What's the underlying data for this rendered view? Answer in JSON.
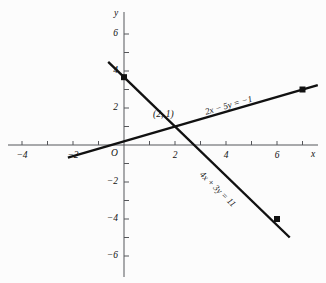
{
  "figure": {
    "background_color": "#fcfcfc",
    "line_color": "#111111",
    "axis_color": "#55565a",
    "width": 326,
    "height": 283
  },
  "axes": {
    "x_name": "x",
    "y_name": "y",
    "origin_label": "O",
    "x_ticks": [
      {
        "value": -4,
        "label": "−4"
      },
      {
        "value": -3,
        "label": ""
      },
      {
        "value": -2,
        "label": "−2"
      },
      {
        "value": -1,
        "label": ""
      },
      {
        "value": 1,
        "label": ""
      },
      {
        "value": 2,
        "label": "2"
      },
      {
        "value": 3,
        "label": ""
      },
      {
        "value": 4,
        "label": "4"
      },
      {
        "value": 5,
        "label": ""
      },
      {
        "value": 6,
        "label": "6"
      },
      {
        "value": 7,
        "label": ""
      }
    ],
    "y_ticks": [
      {
        "value": 6,
        "label": "6"
      },
      {
        "value": 5,
        "label": ""
      },
      {
        "value": 4,
        "label": "4"
      },
      {
        "value": 3,
        "label": ""
      },
      {
        "value": 2,
        "label": "2"
      },
      {
        "value": 1,
        "label": ""
      },
      {
        "value": -1,
        "label": ""
      },
      {
        "value": -2,
        "label": "−2"
      },
      {
        "value": -3,
        "label": ""
      },
      {
        "value": -4,
        "label": "−4"
      },
      {
        "value": -5,
        "label": ""
      },
      {
        "value": -6,
        "label": "−6"
      }
    ]
  },
  "chart_data": {
    "type": "line",
    "title": "",
    "xlabel": "x",
    "ylabel": "y",
    "xlim": [
      -4.9,
      7.9
    ],
    "ylim": [
      -7.0,
      7.1
    ],
    "grid": false,
    "legend": "inline-labels",
    "series": [
      {
        "name": "2x − 5y = −1",
        "label": "2x − 5y = −1",
        "slope": 0.4,
        "intercept": 0.2,
        "x": [
          -2.2,
          7.6
        ],
        "y": [
          -0.68,
          3.24
        ],
        "points": [
          {
            "x": 7,
            "y": 3,
            "marker": "filled-square"
          }
        ]
      },
      {
        "name": "4x + 3y = 11",
        "label": "4x + 3y = 11",
        "slope": -1.3333,
        "intercept": 3.6667,
        "x": [
          -0.62,
          6.5
        ],
        "y": [
          4.49,
          -5.0
        ],
        "points": [
          {
            "x": 0,
            "y": 3.6667,
            "marker": "filled-square"
          },
          {
            "x": 6,
            "y": -4,
            "marker": "filled-square"
          }
        ]
      }
    ],
    "annotations": [
      {
        "text": "(2, 1)",
        "x": 2,
        "y": 1,
        "note": "intersection point of the two lines"
      }
    ]
  }
}
